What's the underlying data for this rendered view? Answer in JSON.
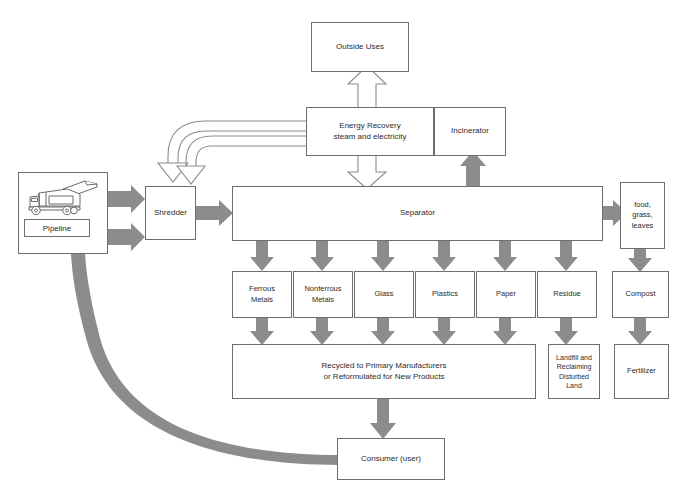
{
  "diagram": {
    "colors": {
      "box_stroke": "#6e6e6e",
      "text": "#2b2b2b",
      "solid_arrow": "#8c8c8c",
      "hollow_arrow_stroke": "#8c8c8c",
      "background": "#ffffff"
    }
  },
  "nodes": {
    "outside_uses": "Outside Uses",
    "energy_recovery": "Energy Recovery\nsteam and electricity",
    "incinerator": "Incinerator",
    "source_truck_icon": "garbage-truck-icon",
    "pipeline": "Pipeline",
    "shredder": "Shredder",
    "separator": "Separator",
    "organics": "food,\ngrass,\nleaves",
    "ferrous_metals": "Ferrous\nMetals",
    "nonferrous_metals": "Nonferrous\nMetals",
    "glass": "Glass",
    "plastics": "Plastics",
    "paper": "Paper",
    "residue": "Residue",
    "compost": "Compost",
    "recycled": "Recycled to Primary Manufacturers\nor Reformulated for New Products",
    "landfill": "Landfill and\nReclaiming\nDisturbed\nLand",
    "fertilizer": "Fertilizer",
    "consumer": "Consumer (user)"
  },
  "flows": [
    {
      "from": "source",
      "to": "shredder",
      "style": "solid-gray"
    },
    {
      "from": "source",
      "to": "shredder",
      "style": "solid-gray"
    },
    {
      "from": "shredder",
      "to": "separator",
      "style": "solid-gray"
    },
    {
      "from": "energy_recovery",
      "to": "shredder",
      "style": "hollow-outline"
    },
    {
      "from": "energy_recovery",
      "to": "shredder",
      "style": "hollow-outline"
    },
    {
      "from": "energy_recovery",
      "to": "outside_uses",
      "style": "hollow-outline"
    },
    {
      "from": "energy_recovery",
      "to": "separator",
      "style": "hollow-outline"
    },
    {
      "from": "incinerator",
      "to": "energy_recovery",
      "style": "hollow-outline"
    },
    {
      "from": "incinerator",
      "to": "energy_recovery",
      "style": "hollow-outline"
    },
    {
      "from": "separator",
      "to": "incinerator",
      "style": "solid-gray"
    },
    {
      "from": "separator",
      "to": "organics",
      "style": "solid-gray"
    },
    {
      "from": "separator",
      "to": "ferrous_metals",
      "style": "solid-gray"
    },
    {
      "from": "separator",
      "to": "nonferrous_metals",
      "style": "solid-gray"
    },
    {
      "from": "separator",
      "to": "glass",
      "style": "solid-gray"
    },
    {
      "from": "separator",
      "to": "plastics",
      "style": "solid-gray"
    },
    {
      "from": "separator",
      "to": "paper",
      "style": "solid-gray"
    },
    {
      "from": "separator",
      "to": "residue",
      "style": "solid-gray"
    },
    {
      "from": "organics",
      "to": "compost",
      "style": "solid-gray"
    },
    {
      "from": "ferrous_metals",
      "to": "recycled",
      "style": "solid-gray"
    },
    {
      "from": "nonferrous_metals",
      "to": "recycled",
      "style": "solid-gray"
    },
    {
      "from": "glass",
      "to": "recycled",
      "style": "solid-gray"
    },
    {
      "from": "plastics",
      "to": "recycled",
      "style": "solid-gray"
    },
    {
      "from": "paper",
      "to": "recycled",
      "style": "solid-gray"
    },
    {
      "from": "residue",
      "to": "landfill",
      "style": "solid-gray"
    },
    {
      "from": "compost",
      "to": "fertilizer",
      "style": "solid-gray"
    },
    {
      "from": "recycled",
      "to": "consumer",
      "style": "solid-gray"
    },
    {
      "from": "consumer",
      "to": "source",
      "style": "solid-gray-curved"
    }
  ]
}
